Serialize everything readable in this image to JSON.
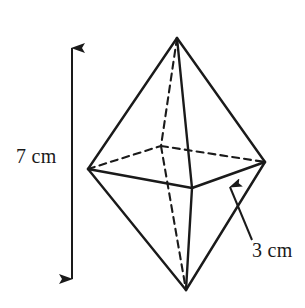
{
  "figure": {
    "kind": "square-bipyramid-diagram",
    "background_color": "#ffffff",
    "stroke_color": "#1a1a1a",
    "labels": {
      "height": "7 cm",
      "base_edge": "3 cm"
    },
    "annotations": {
      "height_dimension_arrow": "double-headed vertical arrow spanning full solid height",
      "base_edge_pointer": "single-headed arrow pointing to front-right base edge"
    },
    "vertices": {
      "top_apex": [
        177,
        38
      ],
      "bottom_apex": [
        186,
        290
      ],
      "left": [
        88,
        169
      ],
      "right": [
        265,
        162
      ],
      "front": [
        192,
        188
      ],
      "back_hidden": [
        161,
        146
      ]
    },
    "edges_solid": [
      "top_apex-left",
      "top_apex-right",
      "top_apex-front",
      "left-front",
      "front-right",
      "bottom_apex-left",
      "bottom_apex-right",
      "bottom_apex-front"
    ],
    "edges_dashed": [
      "top_apex-back_hidden",
      "back_hidden-bottom_apex",
      "left-back_hidden",
      "back_hidden-right"
    ],
    "dimension_line": {
      "x": 72,
      "y_top": 42,
      "y_bottom": 285
    },
    "pointer_line": {
      "tip": [
        227,
        180
      ],
      "tail": [
        252,
        240
      ]
    }
  }
}
